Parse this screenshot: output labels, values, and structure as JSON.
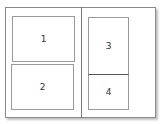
{
  "diagram": {
    "type": "page-layout",
    "frame": {
      "columns": 2
    },
    "boxes": [
      {
        "label": "1",
        "column": "left",
        "position": "top"
      },
      {
        "label": "2",
        "column": "left",
        "position": "bottom"
      },
      {
        "label": "3",
        "column": "right",
        "position": "top"
      },
      {
        "label": "4",
        "column": "right",
        "position": "bottom"
      }
    ]
  }
}
